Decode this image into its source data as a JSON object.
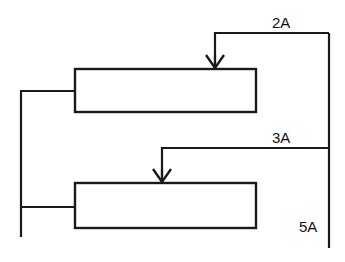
{
  "diagram": {
    "type": "process-flow-diagram",
    "background_color": "#ffffff",
    "line_color": "#1a1a1a",
    "text_color": "#111111",
    "units": [
      {
        "id": "unit-top",
        "label": "",
        "x": 75,
        "y": 69,
        "width": 181,
        "height": 43
      },
      {
        "id": "unit-bottom",
        "label": "",
        "x": 75,
        "y": 183,
        "width": 181,
        "height": 45
      }
    ],
    "streams": [
      {
        "id": "stream-2a",
        "label": "2A",
        "label_x": 272,
        "label_y": 28
      },
      {
        "id": "stream-3a",
        "label": "3A",
        "label_x": 272,
        "label_y": 143
      },
      {
        "id": "stream-5a",
        "label": "5A",
        "label_x": 299,
        "label_y": 232
      }
    ],
    "arrows": [
      {
        "id": "arrow-into-top-unit",
        "x": 215,
        "tip_y": 69,
        "direction": "down"
      },
      {
        "id": "arrow-into-bottom-unit",
        "x": 162,
        "tip_y": 183,
        "direction": "down"
      }
    ]
  }
}
